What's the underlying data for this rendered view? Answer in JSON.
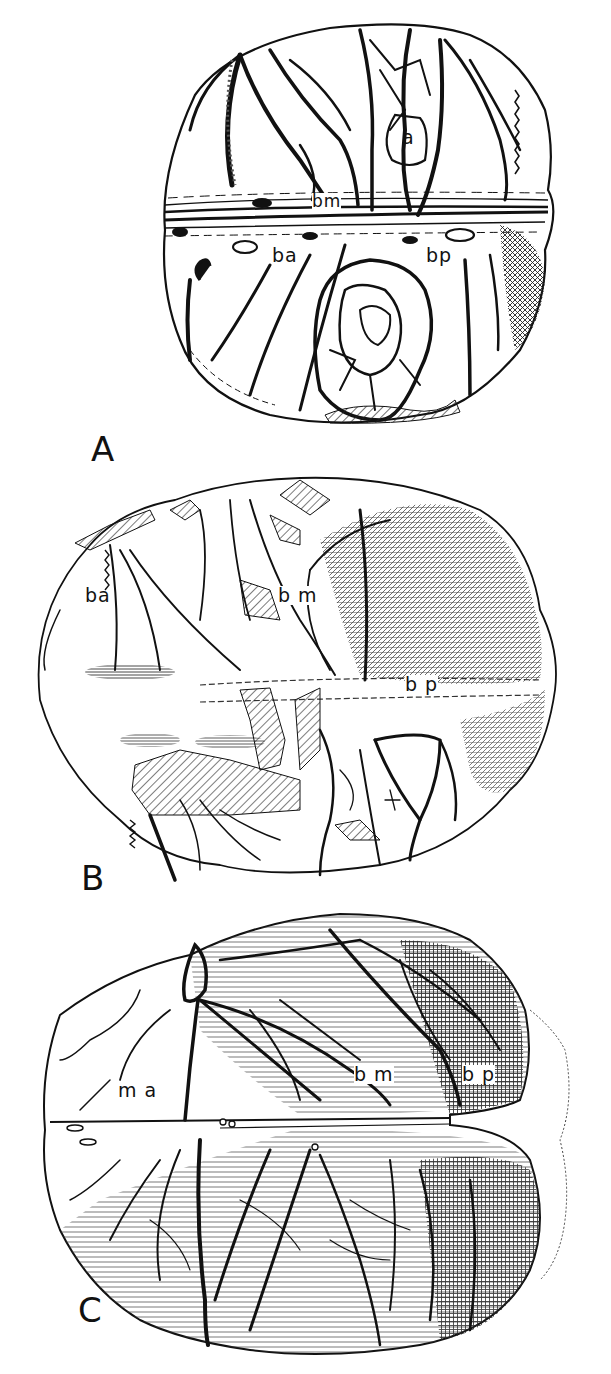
{
  "figure": {
    "panels": [
      {
        "letter": "A",
        "labels": {
          "a": "a",
          "bm": "bm",
          "ba": "ba",
          "bp": "bp"
        }
      },
      {
        "letter": "B",
        "labels": {
          "ba": "ba",
          "bm": "b m",
          "bp": "b p"
        }
      },
      {
        "letter": "C",
        "labels": {
          "ma": "m a",
          "bm": "b m",
          "bp": "b p"
        }
      }
    ],
    "colors": {
      "ink": "#111111",
      "paper": "#ffffff",
      "hatch": "#333333"
    }
  }
}
